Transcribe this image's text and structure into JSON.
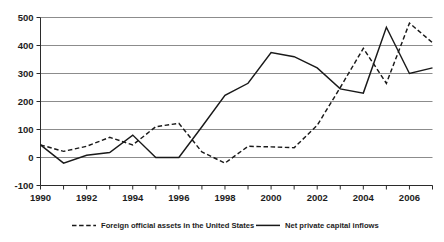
{
  "chart_data": {
    "type": "line",
    "title": "",
    "subtitle": "",
    "xlabel": "",
    "ylabel": "",
    "xlim": [
      1990,
      2007
    ],
    "ylim": [
      -100,
      500
    ],
    "yticks": [
      -100,
      0,
      100,
      200,
      300,
      400,
      500
    ],
    "ytick_labels": [
      "-100",
      "0",
      "100",
      "200",
      "300",
      "400",
      "500"
    ],
    "xticks": [
      1990,
      1991,
      1992,
      1993,
      1994,
      1995,
      1996,
      1997,
      1998,
      1999,
      2000,
      2001,
      2002,
      2003,
      2004,
      2005,
      2006,
      2007
    ],
    "xtick_labels": [
      "1990",
      "",
      "1992",
      "",
      "1994",
      "",
      "1996",
      "",
      "1998",
      "",
      "2000",
      "",
      "2002",
      "",
      "2004",
      "",
      "2006",
      ""
    ],
    "xtick_labels_visible": [
      "1990",
      "1992",
      "1994",
      "1996",
      "1998",
      "2000",
      "2002",
      "2004",
      "2006"
    ],
    "grid": true,
    "grid_axis": "y",
    "legend_position": "bottom",
    "x": [
      1990,
      1991,
      1992,
      1993,
      1994,
      1995,
      1996,
      1997,
      1998,
      1999,
      2000,
      2001,
      2002,
      2003,
      2004,
      2005,
      2006,
      2007
    ],
    "series": [
      {
        "name": "Foreign official assets in the United States",
        "style": "dashed",
        "color": "#191919",
        "values": [
          45,
          22,
          40,
          72,
          45,
          110,
          122,
          20,
          -20,
          40,
          38,
          35,
          115,
          250,
          390,
          265,
          480,
          410
        ]
      },
      {
        "name": "Net private capital inflows",
        "style": "solid",
        "color": "#191919",
        "values": [
          45,
          -20,
          8,
          18,
          80,
          0,
          0,
          110,
          222,
          265,
          375,
          360,
          320,
          245,
          230,
          465,
          300,
          320
        ]
      }
    ]
  },
  "legend": {
    "items": [
      {
        "label": "Foreign official assets in the United States",
        "style": "dashed"
      },
      {
        "label": "Net private capital inflows",
        "style": "solid"
      }
    ]
  }
}
